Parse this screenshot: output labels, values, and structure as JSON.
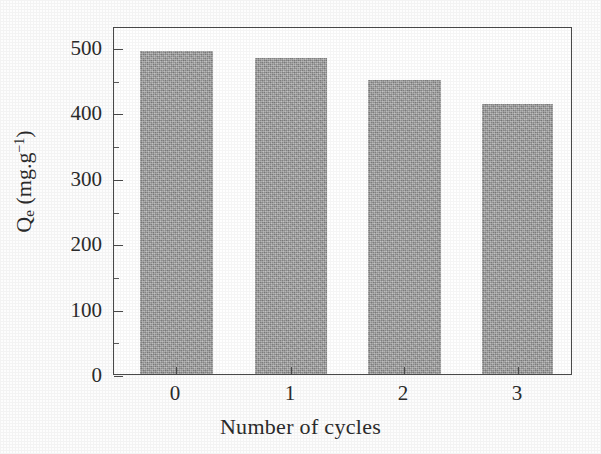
{
  "chart_data": {
    "type": "bar",
    "title": "",
    "xlabel": "Number of cycles",
    "ylabel": "Qe (mg.g-1)",
    "ylabel_parts": {
      "symbol": "Q",
      "subscript": "e",
      "unit_open": " (mg.g",
      "superscript": "−1",
      "unit_close": ")"
    },
    "categories": [
      "0",
      "1",
      "2",
      "3"
    ],
    "values": [
      494,
      483,
      449,
      413
    ],
    "ylim": [
      0,
      532
    ],
    "xlim_note": "categorical",
    "ymajor_ticks": [
      0,
      100,
      200,
      300,
      400,
      500
    ],
    "yminor_ticks": [
      50,
      150,
      250,
      350,
      450
    ],
    "ytick_labels": [
      "0",
      "100",
      "200",
      "300",
      "400",
      "500"
    ],
    "xtick_labels": [
      "0",
      "1",
      "2",
      "3"
    ],
    "grid": false,
    "legend": null,
    "legend_position": "none",
    "bar_color": "#9b9b9b",
    "axis_color": "#4a4a4a",
    "background_color": "#ffffff",
    "series": [
      {
        "name": "Qe",
        "values": [
          494,
          483,
          449,
          413
        ]
      }
    ],
    "data_points": [
      {
        "cycle": "0",
        "qe": 494
      },
      {
        "cycle": "1",
        "qe": 483
      },
      {
        "cycle": "2",
        "qe": 449
      },
      {
        "cycle": "3",
        "qe": 413
      }
    ]
  }
}
